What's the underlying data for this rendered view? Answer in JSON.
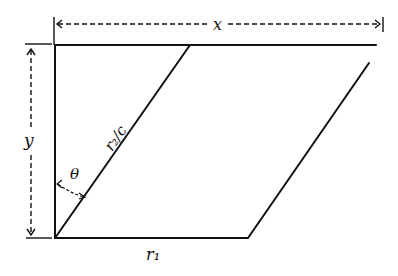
{
  "diagram": {
    "labels": {
      "x": "x",
      "y": "y",
      "theta": "θ",
      "r2c": "r₂/c",
      "r1": "r₁"
    },
    "colors": {
      "ink": "#111111",
      "background": "#ffffff"
    }
  }
}
